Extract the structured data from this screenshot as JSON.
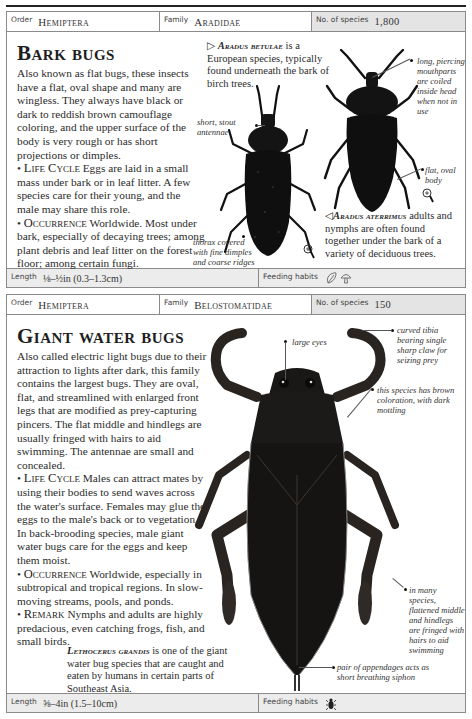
{
  "entries": [
    {
      "header": {
        "order_label": "Order",
        "order_value": "Hemiptera",
        "family_label": "Family",
        "family_value": "Aradidae",
        "species_label": "No. of species",
        "species_value": "1,800"
      },
      "title": "Bark bugs",
      "intro": "Also known as flat bugs, these insects have a flat, oval shape and many are wingless. They always have black or dark to reddish brown camouflage coloring, and the upper surface of the body is very rough or has short projections or dimples.",
      "sections": [
        {
          "heading": "Life Cycle",
          "text": "Eggs are laid in a small mass under bark or in leaf litter. A few species care for their young, and the male may share this role."
        },
        {
          "heading": "Occurrence",
          "text": "Worldwide. Most under bark, especially of decaying trees; among plant debris and leaf litter on the forest floor; among certain fungi."
        }
      ],
      "captions": [
        {
          "marker": "▷",
          "species": "Aradus betulae",
          "text": "is a European species, typically found underneath the bark of birch trees."
        },
        {
          "marker": "◁",
          "species": "Aradus aterrimus",
          "text": "adults and nymphs are often found together under the bark of a variety of deciduous trees."
        }
      ],
      "annotations": [
        "short, stout antennae",
        "long, piercing mouthparts are coiled inside head when not in use",
        "flat, oval body",
        "thorax covered with fine dimples and coarse ridges"
      ],
      "footer": {
        "length_label": "Length",
        "length_value": "⅛–½in (0.3–1.3cm)",
        "feeding_label": "Feeding habits",
        "feeding_icons": [
          "leaf-icon",
          "mushroom-icon"
        ]
      }
    },
    {
      "header": {
        "order_label": "Order",
        "order_value": "Hemiptera",
        "family_label": "Family",
        "family_value": "Belostomatidae",
        "species_label": "No. of species",
        "species_value": "150"
      },
      "title": "Giant water bugs",
      "intro": "Also called electric light bugs due to their attraction to lights after dark, this family contains the largest bugs. They are oval, flat, and streamlined with enlarged front legs that are modified as prey-capturing pincers. The flat middle and hindlegs are usually fringed with hairs to aid swimming. The antennae are small and concealed.",
      "sections": [
        {
          "heading": "Life Cycle",
          "text": "Males can attract mates by using their bodies to send waves across the water's surface. Females may glue the eggs to the male's back or to vegetation. In back-brooding species, male giant water bugs care for the eggs and keep them moist."
        },
        {
          "heading": "Occurrence",
          "text": "Worldwide, especially in subtropical and tropical regions. In slow-moving streams, pools, and ponds."
        },
        {
          "heading": "Remark",
          "text": "Nymphs and adults are highly predacious, even catching frogs, fish, and small birds."
        }
      ],
      "captions": [
        {
          "marker": "",
          "species": "Lethocerus grandis",
          "text": "is one of the giant water bug species that are caught and eaten by humans in certain parts of Southeast Asia."
        }
      ],
      "annotations": [
        "large eyes",
        "curved tibia bearing single sharp claw for seizing prey",
        "this species has brown coloration, with dark mottling",
        "in many species, flattened middle and hindlegs are fringed with hairs to aid swimming",
        "pair of appendages acts as short breathing siphon"
      ],
      "footer": {
        "length_label": "Length",
        "length_value": "⅝–4in (1.5–10cm)",
        "feeding_label": "Feeding habits",
        "feeding_icons": [
          "insect-icon"
        ]
      }
    }
  ]
}
